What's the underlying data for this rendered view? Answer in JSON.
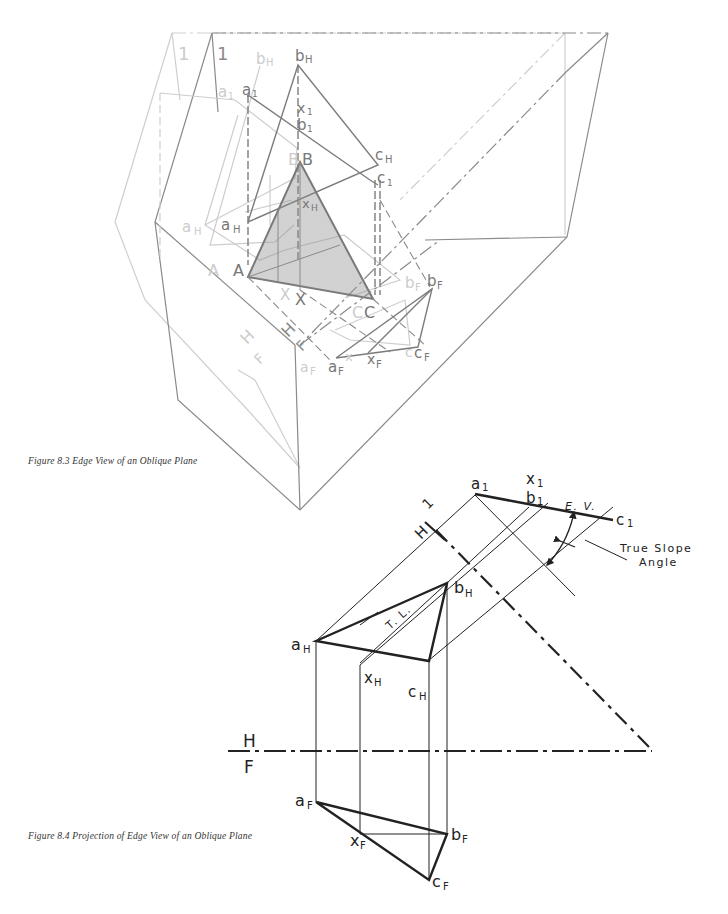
{
  "figure_8_3": {
    "caption": "Figure 8.3  Edge View of an Oblique Plane",
    "labels": {
      "fold_1": "1",
      "fold_1_ghost": "1",
      "bH": "b",
      "bH_sub": "H",
      "bH_ghost": "b",
      "bH_ghost_sub": "H",
      "a1": "a",
      "a1_sub": "1",
      "a1_ghost": "a",
      "a1_ghost_sub": "1",
      "x1": "x",
      "x1_sub": "1",
      "b1": "b",
      "b1_sub": "1",
      "cH": "c",
      "cH_sub": "H",
      "c1": "c",
      "c1_sub": "1",
      "B": "B",
      "B_ghost": "B",
      "xH": "x",
      "xH_sub": "H",
      "aH": "a",
      "aH_sub": "H",
      "aH_ghost": "a",
      "aH_ghost_sub": "H",
      "A": "A",
      "A_ghost": "A",
      "X": "X",
      "X_ghost": "X",
      "C": "C",
      "C_ghost": "C",
      "bF": "b",
      "bF_sub": "F",
      "bF_ghost": "b",
      "bF_ghost_sub": "F",
      "cF": "c",
      "cF_sub": "F",
      "cF_ghost": "c",
      "xF": "x",
      "xF_sub": "F",
      "aF": "a",
      "aF_sub": "F",
      "aF_ghost": "a",
      "aF_ghost_sub": "F",
      "fold_H": "H",
      "fold_F": "F",
      "fold_H_ghost": "H",
      "fold_F_ghost": "F"
    }
  },
  "figure_8_4": {
    "caption": "Figure 8.4  Projection of Edge View of an Oblique Plane",
    "labels": {
      "fold_H1": "H",
      "fold_H1_one": "1",
      "a1": "a",
      "a1_sub": "1",
      "x1": "x",
      "x1_sub": "1",
      "b1": "b",
      "b1_sub": "1",
      "c1": "c",
      "c1_sub": "1",
      "ev": "E. V.",
      "true_slope_line1": "True Slope",
      "true_slope_line2": "Angle",
      "bH": "b",
      "bH_sub": "H",
      "tl": "T. L.",
      "aH": "a",
      "aH_sub": "H",
      "xH": "x",
      "xH_sub": "H",
      "cH": "c",
      "cH_sub": "H",
      "fold_H": "H",
      "fold_F": "F",
      "aF": "a",
      "aF_sub": "F",
      "xF": "x",
      "xF_sub": "F",
      "bF": "b",
      "bF_sub": "F",
      "cF": "c",
      "cF_sub": "F"
    }
  },
  "colors": {
    "ink": "#222222",
    "mid_gray": "#7a7a7a",
    "light_gray": "#c9c9c9",
    "hatch": "#9a9a9a"
  }
}
